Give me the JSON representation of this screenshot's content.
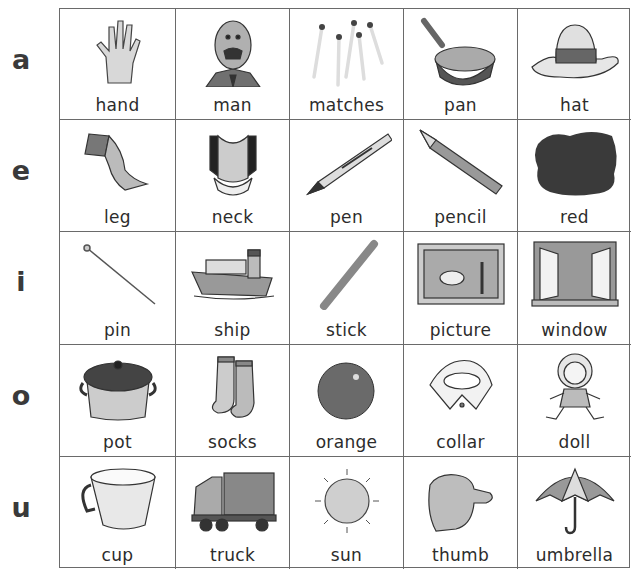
{
  "rows": [
    {
      "vowel": "a",
      "items": [
        {
          "word": "hand",
          "icon": "hand-icon"
        },
        {
          "word": "man",
          "icon": "man-icon"
        },
        {
          "word": "matches",
          "icon": "matches-icon"
        },
        {
          "word": "pan",
          "icon": "pan-icon"
        },
        {
          "word": "hat",
          "icon": "hat-icon"
        }
      ]
    },
    {
      "vowel": "e",
      "items": [
        {
          "word": "leg",
          "icon": "leg-icon"
        },
        {
          "word": "neck",
          "icon": "neck-icon"
        },
        {
          "word": "pen",
          "icon": "pen-icon"
        },
        {
          "word": "pencil",
          "icon": "pencil-icon"
        },
        {
          "word": "red",
          "icon": "red-blot-icon"
        }
      ]
    },
    {
      "vowel": "i",
      "items": [
        {
          "word": "pin",
          "icon": "pin-icon"
        },
        {
          "word": "ship",
          "icon": "ship-icon"
        },
        {
          "word": "stick",
          "icon": "stick-icon"
        },
        {
          "word": "picture",
          "icon": "picture-icon"
        },
        {
          "word": "window",
          "icon": "window-icon"
        }
      ]
    },
    {
      "vowel": "o",
      "items": [
        {
          "word": "pot",
          "icon": "pot-icon"
        },
        {
          "word": "socks",
          "icon": "socks-icon"
        },
        {
          "word": "orange",
          "icon": "orange-icon"
        },
        {
          "word": "collar",
          "icon": "collar-icon"
        },
        {
          "word": "doll",
          "icon": "doll-icon"
        }
      ]
    },
    {
      "vowel": "u",
      "items": [
        {
          "word": "cup",
          "icon": "cup-icon"
        },
        {
          "word": "truck",
          "icon": "truck-icon"
        },
        {
          "word": "sun",
          "icon": "sun-icon"
        },
        {
          "word": "thumb",
          "icon": "thumb-icon"
        },
        {
          "word": "umbrella",
          "icon": "umbrella-icon"
        }
      ]
    }
  ]
}
